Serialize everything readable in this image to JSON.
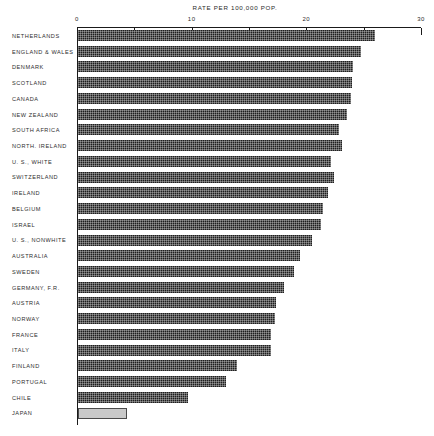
{
  "chart_data": {
    "type": "bar",
    "orientation": "horizontal",
    "title": "RATE PER 100,000 POP.",
    "xlabel": "",
    "ylabel": "",
    "xlim": [
      0,
      30
    ],
    "xticks_labeled": [
      0,
      10,
      20,
      30
    ],
    "xticks_all": [
      0,
      5,
      10,
      15,
      20,
      25,
      30
    ],
    "grid": false,
    "legend": "none",
    "bar_fill": "#1f1f1f",
    "highlight_fill": "#c9c9c9",
    "categories": [
      "NETHERLANDS",
      "ENGLAND & WALES",
      "DENMARK",
      "SCOTLAND",
      "CANADA",
      "NEW ZEALAND",
      "SOUTH AFRICA",
      "NORTH. IRELAND",
      "U. S., WHITE",
      "SWITZERLAND",
      "IRELAND",
      "BELGIUM",
      "ISRAEL",
      "U. S., NONWHITE",
      "AUSTRALIA",
      "SWEDEN",
      "GERMANY, F.R.",
      "AUSTRIA",
      "NORWAY",
      "FRANCE",
      "ITALY",
      "FINLAND",
      "PORTUGAL",
      "CHILE",
      "JAPAN"
    ],
    "values": [
      25.9,
      24.7,
      24.0,
      23.9,
      23.8,
      23.5,
      22.8,
      23.0,
      22.1,
      22.3,
      21.8,
      21.4,
      21.2,
      20.4,
      19.4,
      18.8,
      18.0,
      17.3,
      17.2,
      16.8,
      16.8,
      13.9,
      12.9,
      9.6,
      4.3
    ],
    "styles": [
      "dark",
      "dark",
      "dark",
      "dark",
      "dark",
      "dark",
      "dark",
      "dark",
      "dark",
      "dark",
      "dark",
      "dark",
      "dark",
      "dark",
      "dark",
      "dark",
      "dark",
      "dark",
      "dark",
      "dark",
      "dark",
      "dark",
      "dark",
      "dark",
      "light"
    ]
  }
}
